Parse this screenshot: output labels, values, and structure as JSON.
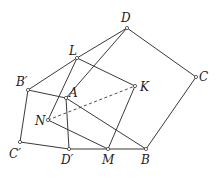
{
  "diagram": {
    "points": {
      "D": {
        "label": "D",
        "x": 127,
        "y": 28,
        "lx": 121,
        "ly": 22
      },
      "C": {
        "label": "C",
        "x": 196,
        "y": 77,
        "lx": 199,
        "ly": 81
      },
      "B": {
        "label": "B",
        "x": 146,
        "y": 149,
        "lx": 141,
        "ly": 164
      },
      "M": {
        "label": "M",
        "x": 108,
        "y": 149,
        "lx": 102,
        "ly": 164
      },
      "Dp": {
        "label": "D′",
        "x": 69,
        "y": 149,
        "lx": 61,
        "ly": 164
      },
      "Cp": {
        "label": "C′",
        "x": 20,
        "y": 142,
        "lx": 9,
        "ly": 158
      },
      "Bp": {
        "label": "B′",
        "x": 28,
        "y": 90,
        "lx": 16,
        "ly": 86
      },
      "L": {
        "label": "L",
        "x": 77,
        "y": 58,
        "lx": 69,
        "ly": 55
      },
      "A": {
        "label": "A",
        "x": 66,
        "y": 98,
        "lx": 69,
        "ly": 97
      },
      "N": {
        "label": "N",
        "x": 48,
        "y": 120,
        "lx": 35,
        "ly": 125
      },
      "K": {
        "label": "K",
        "x": 135,
        "y": 86,
        "lx": 140,
        "ly": 91
      }
    },
    "segments": [
      [
        "D",
        "L"
      ],
      [
        "L",
        "Bp"
      ],
      [
        "D",
        "C"
      ],
      [
        "C",
        "B"
      ],
      [
        "B",
        "M"
      ],
      [
        "M",
        "Dp"
      ],
      [
        "Dp",
        "Cp"
      ],
      [
        "Cp",
        "Bp"
      ],
      [
        "Bp",
        "A"
      ],
      [
        "A",
        "Dp"
      ],
      [
        "A",
        "B"
      ],
      [
        "L",
        "K"
      ],
      [
        "K",
        "M"
      ],
      [
        "L",
        "N"
      ],
      [
        "N",
        "M"
      ],
      [
        "D",
        "A"
      ]
    ],
    "dashed": [
      [
        "N",
        "K"
      ]
    ]
  }
}
